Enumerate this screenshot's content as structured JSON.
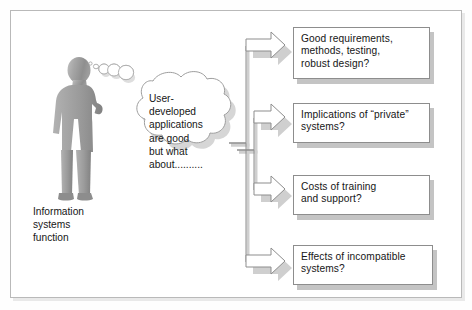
{
  "diagram": {
    "title_caption": "Information systems function",
    "actor": {
      "name": "person-silhouette",
      "caption_lines": [
        "Information",
        "systems",
        "function"
      ]
    },
    "thought_cloud": {
      "lines": [
        "User-",
        "developed",
        "applications",
        "are good",
        "but what",
        "about.........."
      ],
      "text": "User-developed applications are good but what about.........."
    },
    "branches": [
      {
        "id": "branch-1",
        "lines": [
          "Good requirements,",
          "methods, testing,",
          "robust design?"
        ],
        "text": "Good requirements, methods, testing, robust design?"
      },
      {
        "id": "branch-2",
        "lines": [
          "Implications of “private”",
          "systems?"
        ],
        "text": "Implications of “private” systems?"
      },
      {
        "id": "branch-3",
        "lines": [
          "Costs of training",
          "and support?"
        ],
        "text": "Costs of training and support?"
      },
      {
        "id": "branch-4",
        "lines": [
          "Effects of incompatible",
          "systems?"
        ],
        "text": "Effects of incompatible systems?"
      }
    ],
    "colors": {
      "frame_border": "#b9b9b9",
      "box_border": "#8d8d8d",
      "shadow": "#c4c4c4",
      "silhouette_light": "#b4b4b4",
      "silhouette_dark": "#8a8a8a",
      "arrow_fill": "#ffffff",
      "arrow_stroke": "#8d8d8d",
      "text": "#161616",
      "background": "#ffffff"
    }
  }
}
